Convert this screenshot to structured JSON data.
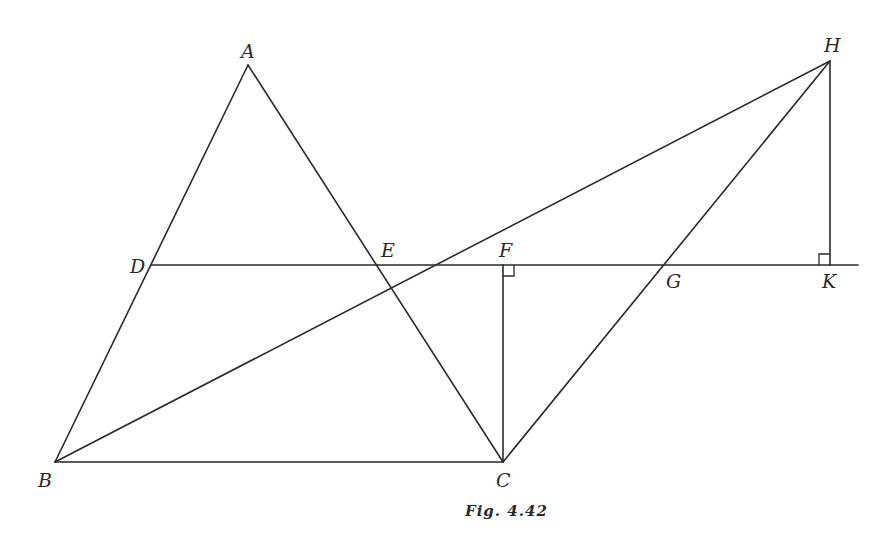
{
  "figure": {
    "caption": "Fig. 4.42",
    "points": {
      "A": {
        "label": "A",
        "x": 248,
        "y": 65
      },
      "B": {
        "label": "B",
        "x": 55,
        "y": 462
      },
      "C": {
        "label": "C",
        "x": 503,
        "y": 462
      },
      "D": {
        "label": "D",
        "x": 151,
        "y": 265
      },
      "E": {
        "label": "E",
        "x": 375,
        "y": 265
      },
      "F": {
        "label": "F",
        "x": 503,
        "y": 265
      },
      "G": {
        "label": "G",
        "x": 663,
        "y": 265
      },
      "H": {
        "label": "H",
        "x": 830,
        "y": 61
      },
      "K": {
        "label": "K",
        "x": 830,
        "y": 265
      }
    },
    "segments": [
      {
        "name": "AB",
        "from": "A",
        "to": "B"
      },
      {
        "name": "AC",
        "from": "A",
        "to": "C"
      },
      {
        "name": "BC",
        "from": "B",
        "to": "C"
      },
      {
        "name": "BH",
        "from": "B",
        "to": "H"
      },
      {
        "name": "CH",
        "from": "C",
        "to": "H"
      },
      {
        "name": "CF",
        "from": "C",
        "to": "F"
      },
      {
        "name": "HK",
        "from": "H",
        "to": "K"
      },
      {
        "name": "DK-extended",
        "from": "D",
        "to": "K",
        "extends_to_x": 858
      }
    ],
    "right_angles": [
      "F",
      "K"
    ],
    "colors": {
      "ink": "#2a2a2a",
      "background": "#ffffff"
    }
  }
}
